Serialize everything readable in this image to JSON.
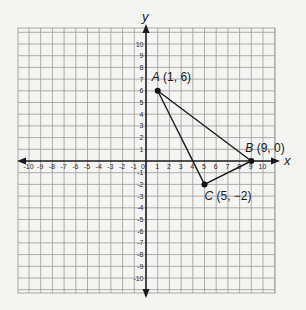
{
  "chart_data": {
    "type": "scatter",
    "title": "",
    "xlabel": "x",
    "ylabel": "y",
    "xlim": [
      -11,
      11
    ],
    "ylim": [
      -11,
      11
    ],
    "grid": true,
    "x_ticks": [
      -10,
      -9,
      -8,
      -7,
      -6,
      -5,
      -4,
      -3,
      -2,
      -1,
      0,
      1,
      2,
      3,
      4,
      5,
      6,
      7,
      8,
      9,
      10
    ],
    "y_ticks": [
      10,
      9,
      8,
      7,
      6,
      5,
      4,
      3,
      2,
      1,
      -1,
      -2,
      -3,
      -4,
      -5,
      -6,
      -7,
      -8,
      -9,
      -10
    ],
    "x_tick_labels": [
      "10",
      "9",
      "8",
      "7",
      "6",
      "5",
      "4",
      "3",
      "2",
      "1",
      "0",
      "1",
      "2",
      "3",
      "4",
      "5",
      "6",
      "7",
      "8",
      "9",
      "10"
    ],
    "y_tick_labels": [
      "10",
      "9",
      "8",
      "7",
      "6",
      "5",
      "4",
      "3",
      "2",
      "1",
      "1",
      "2",
      "3",
      "4",
      "5",
      "6",
      "7",
      "8",
      "9",
      "10"
    ],
    "points": [
      {
        "name": "A",
        "x": 1,
        "y": 6,
        "label": "(1, 6)"
      },
      {
        "name": "B",
        "x": 9,
        "y": 0,
        "label": "(9, 0)"
      },
      {
        "name": "C",
        "x": 5,
        "y": -2,
        "label": "(5, −2)"
      }
    ],
    "polygon": [
      "A",
      "B",
      "C"
    ],
    "shape": "triangle"
  }
}
